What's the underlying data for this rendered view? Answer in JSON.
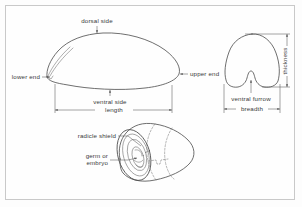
{
  "figure": {
    "background_color": "#fdfdfd",
    "border_color": "#c9c9c9",
    "line_color": "#4a4a4a",
    "text_color": "#3a3a3a"
  },
  "views": {
    "side_view": {
      "name": "side view of grain",
      "labels": {
        "dorsal_side": "dorsal side",
        "lower_end": "lower end",
        "upper_end": "upper end",
        "ventral_side": "ventral side",
        "length": "length"
      },
      "arrows": {
        "dorsal_marker": "down-arrow",
        "lower_end_marker": "right-arrow",
        "upper_end_marker": "left-arrow",
        "ventral_marker": "down-arrow",
        "length_marker": "double-headed-dimension-arrow"
      }
    },
    "cross_section_view": {
      "name": "transverse cross section",
      "labels": {
        "ventral_furrow": "ventral furrow",
        "breadth": "breadth",
        "thickness": "thickness"
      },
      "arrows": {
        "furrow_marker": "up-arrow",
        "breadth_marker": "double-headed-dimension-arrow",
        "thickness_marker": "double-headed-dimension-arrow"
      }
    },
    "perspective_view": {
      "name": "three quarter perspective view",
      "labels": {
        "radicle_shield": "radicle shield",
        "germ_or_embryo_line1": "germ or",
        "germ_or_embryo_line2": "embryo"
      },
      "arrows": {
        "radicle_shield_marker": "leader-line",
        "germ_marker": "leader-line-with-arrow"
      }
    }
  }
}
